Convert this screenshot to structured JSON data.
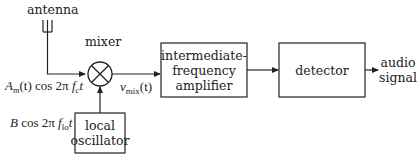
{
  "diagram": {
    "type": "superheterodyne receiver block diagram",
    "colors": {
      "stroke": "#222222",
      "background": "#ffffff"
    },
    "labels": {
      "antenna": "antenna",
      "mixer": "mixer",
      "audio_signal_line1": "audio",
      "audio_signal_line2": "signal"
    },
    "blocks": {
      "if_amplifier": {
        "line1": "intermediate-",
        "line2": "frequency",
        "line3": "amplifier"
      },
      "detector": {
        "label": "detector"
      },
      "local_oscillator": {
        "line1": "local",
        "line2": "oscillator"
      }
    },
    "signals": {
      "rf_input": {
        "amp": "A",
        "amp_sub": "m",
        "arg": "(t) cos 2π ",
        "f": "f",
        "f_sub": "c",
        "t": "t"
      },
      "lo_input": {
        "amp": "B",
        "arg": " cos 2π ",
        "f": "f",
        "f_sub": "lo",
        "t": "t"
      },
      "mixer_output": {
        "v": "v",
        "v_sub": "mix",
        "arg": "(t)"
      }
    }
  }
}
